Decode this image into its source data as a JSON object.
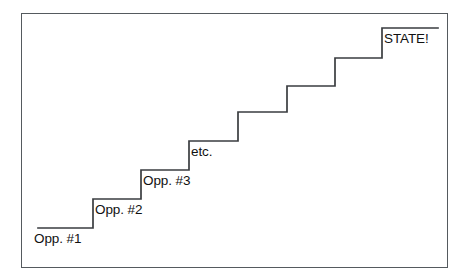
{
  "figure": {
    "border_color": "#555a5e",
    "line_color": "#3a3d40",
    "background_color": "#ffffff",
    "text_color": "#111111"
  },
  "steps": [
    {
      "index": 1,
      "label": "Opp. #1",
      "tread_y": 228,
      "tread_x_start": 38,
      "tread_x_end": 93,
      "label_x": 34,
      "label_y": 234,
      "labeled": true
    },
    {
      "index": 2,
      "label": "Opp. #2",
      "tread_y": 199,
      "tread_x_start": 93,
      "tread_x_end": 141,
      "label_x": 95,
      "label_y": 204,
      "labeled": true
    },
    {
      "index": 3,
      "label": "Opp. #3",
      "tread_y": 170,
      "tread_x_start": 141,
      "tread_x_end": 189,
      "label_x": 143,
      "label_y": 175,
      "labeled": true
    },
    {
      "index": 4,
      "label": "etc.",
      "tread_y": 141,
      "tread_x_start": 189,
      "tread_x_end": 238,
      "label_x": 191,
      "label_y": 146,
      "labeled": true
    },
    {
      "index": 5,
      "label": "",
      "tread_y": 112,
      "tread_x_start": 238,
      "tread_x_end": 287,
      "label_x": 0,
      "label_y": 0,
      "labeled": false
    },
    {
      "index": 6,
      "label": "",
      "tread_y": 86,
      "tread_x_start": 287,
      "tread_x_end": 335,
      "label_x": 0,
      "label_y": 0,
      "labeled": false
    },
    {
      "index": 7,
      "label": "",
      "tread_y": 58,
      "tread_x_start": 335,
      "tread_x_end": 382,
      "label_x": 0,
      "label_y": 0,
      "labeled": false
    },
    {
      "index": 8,
      "label": "STATE!",
      "tread_y": 28,
      "tread_x_start": 382,
      "tread_x_end": 438,
      "label_x": 384,
      "label_y": 33,
      "labeled": true
    }
  ],
  "chart_data": {
    "type": "line",
    "xlabel": "",
    "ylabel": "",
    "categories": [
      "Opp. #1",
      "Opp. #2",
      "Opp. #3",
      "etc.",
      "",
      "",
      "",
      "STATE!"
    ],
    "values": [
      1,
      2,
      3,
      4,
      5,
      6,
      7,
      8
    ],
    "series": [
      {
        "name": "progression",
        "values": [
          1,
          2,
          3,
          4,
          5,
          6,
          7,
          8
        ]
      }
    ],
    "annotations": [
      "Opp. #1",
      "Opp. #2",
      "Opp. #3",
      "etc.",
      "STATE!"
    ],
    "grid": false,
    "legend": "none"
  }
}
